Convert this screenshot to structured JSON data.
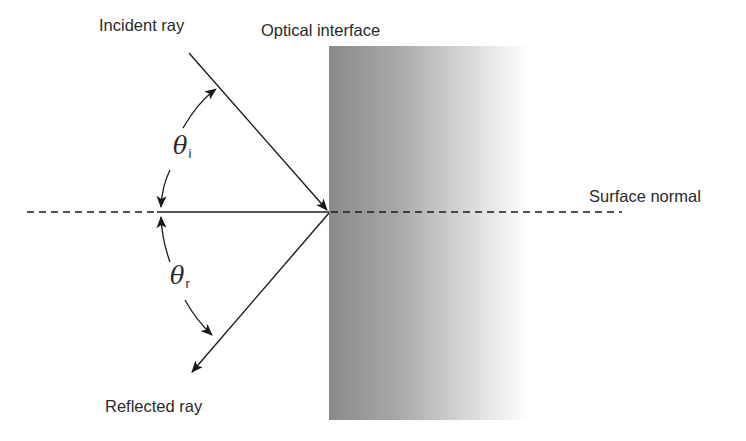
{
  "diagram": {
    "labels": {
      "incident_ray": "Incident ray",
      "optical_interface": "Optical interface",
      "surface_normal": "Surface normal",
      "reflected_ray": "Reflected ray"
    },
    "angles": {
      "incident": {
        "symbol": "θ",
        "subscript": "i"
      },
      "reflected": {
        "symbol": "θ",
        "subscript": "r"
      }
    },
    "colors": {
      "line": "#1a1a1a",
      "text": "#2a2a2a",
      "interface_dark": "#8c8c8c",
      "interface_light": "#ffffff"
    }
  }
}
